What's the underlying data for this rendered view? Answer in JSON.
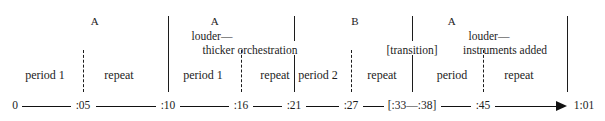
{
  "figure": {
    "type": "musical-form-timeline-diagram",
    "title": "",
    "sections": [
      {
        "letter": "A",
        "letter_x": 95,
        "annotations": [],
        "periods": [
          {
            "label": "period 1",
            "x": 45
          },
          {
            "label": "repeat",
            "x": 119
          }
        ]
      },
      {
        "letter": "A",
        "letter_x": 215,
        "annotations": [
          {
            "text": "louder—",
            "x": 212,
            "align": "center"
          },
          {
            "text": "thicker orchestration",
            "x": 250,
            "align": "center"
          }
        ],
        "periods": [
          {
            "label": "period 1",
            "x": 203
          },
          {
            "label": "repeat",
            "x": 275
          }
        ]
      },
      {
        "letter": "B",
        "letter_x": 355,
        "annotations": [
          {
            "text": "[transition]",
            "x": 412,
            "align": "center"
          }
        ],
        "periods": [
          {
            "label": "period 2",
            "x": 318
          },
          {
            "label": "repeat",
            "x": 382
          }
        ]
      },
      {
        "letter": "A",
        "letter_x": 452,
        "annotations": [
          {
            "text": "louder—",
            "x": 489,
            "align": "center"
          },
          {
            "text": "instruments added",
            "x": 505,
            "align": "center"
          }
        ],
        "periods": [
          {
            "label": "period",
            "x": 452
          },
          {
            "label": "repeat",
            "x": 519
          }
        ]
      }
    ],
    "solid_dividers": [
      {
        "x": 168,
        "top": 16,
        "bottom": 92
      },
      {
        "x": 294,
        "top": 16,
        "bottom": 92
      },
      {
        "x": 412,
        "top": 16,
        "bottom": 92
      },
      {
        "x": 567,
        "top": 16,
        "bottom": 92
      }
    ],
    "dashed_dividers": [
      {
        "x": 83,
        "top": 50,
        "bottom": 92
      },
      {
        "x": 241,
        "top": 50,
        "bottom": 92
      },
      {
        "x": 351,
        "top": 50,
        "bottom": 92
      },
      {
        "x": 483,
        "top": 50,
        "bottom": 92
      }
    ],
    "timeline": {
      "y": 106,
      "start_x": 10,
      "end_x": 595,
      "arrow_tip_x": 560,
      "ticks": [
        {
          "label": "0",
          "x": 15
        },
        {
          "label": ":05",
          "x": 83
        },
        {
          "label": ":10",
          "x": 168
        },
        {
          "label": ":16",
          "x": 241
        },
        {
          "label": ":21",
          "x": 294
        },
        {
          "label": ":27",
          "x": 351
        },
        {
          "label": "[:33—:38]",
          "x": 412
        },
        {
          "label": ":45",
          "x": 483
        },
        {
          "label": "1:01",
          "x": 584
        }
      ]
    },
    "colors": {
      "ink": "#1c1c1c",
      "background": "#ffffff",
      "axis": "#111111"
    }
  }
}
